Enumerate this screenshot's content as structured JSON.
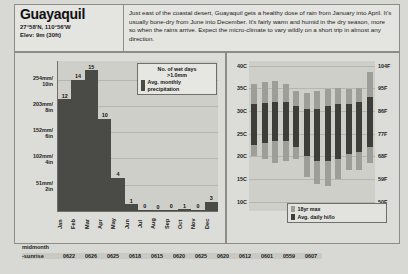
{
  "header": {
    "city": "Guayaquil",
    "coordinates": "27°58'N, 110°56'W",
    "elevation": "Elev: 9m (30ft)",
    "description": "Just east of the coastal desert, Guayaquil gets a healthy dose of rain from January into April. It's usually bone-dry from June into December. It's fairly warm and humid in the dry season, more so when the rains arrive. Expect the micro-climate to vary wildly on a short trip in almost any direction."
  },
  "precip_legend": {
    "wet_days_label": "No. of wet days\n>1.0mm",
    "wet_days_line1": "No. of wet days",
    "wet_days_line2": ">1.0mm",
    "precip_line1": "Avg. monthly",
    "precip_line2": "precipitation",
    "swatch_color": "#4a4a46"
  },
  "temp_legend": {
    "max_label": "18yr max",
    "avg_label": "Avg. daily hi/lo",
    "max_color": "#9e9e98",
    "avg_color": "#3d3d39"
  },
  "footer": {
    "caption": "midmonth",
    "row_label": "-sunrise",
    "sunrise_times": [
      "0622",
      "0626",
      "0625",
      "0618",
      "0615",
      "0620",
      "0625",
      "0620",
      "0612",
      "0601",
      "0559",
      "0607"
    ]
  },
  "chart_data": [
    {
      "type": "bar",
      "title": "Avg. monthly precipitation",
      "categories": [
        "Jan",
        "Feb",
        "Mar",
        "Apr",
        "May",
        "Jun",
        "Jul",
        "Aug",
        "Sep",
        "Oct",
        "Nov",
        "Dec"
      ],
      "values": [
        216,
        254,
        272,
        178,
        64,
        13,
        2,
        1,
        2,
        3,
        2,
        18
      ],
      "wet_days": [
        12,
        14,
        15,
        10,
        4,
        1,
        0,
        0,
        0,
        1,
        0,
        3
      ],
      "ylabel": "Precipitation",
      "ylim": [
        0,
        290
      ],
      "yticks": [
        51,
        102,
        152,
        203,
        254
      ],
      "ytick_labels": [
        {
          "mm": "51mm/",
          "in": "2in"
        },
        {
          "mm": "102mm/",
          "in": "4in"
        },
        {
          "mm": "152mm/",
          "in": "6in"
        },
        {
          "mm": "203mm/",
          "in": "8in"
        },
        {
          "mm": "254mm/",
          "in": "10in"
        }
      ],
      "grid": true,
      "legend_position": "top-right"
    },
    {
      "type": "bar",
      "title": "Temperature range",
      "categories": [
        "Jan",
        "Feb",
        "Mar",
        "Apr",
        "May",
        "Jun",
        "Jul",
        "Aug",
        "Sep",
        "Oct",
        "Nov",
        "Dec"
      ],
      "ylim": [
        8,
        41
      ],
      "yticks_c": [
        40,
        35,
        30,
        25,
        20,
        15,
        10
      ],
      "ytick_labels_c": [
        "40C",
        "35C",
        "30C",
        "25C",
        "20C",
        "15C",
        "10C"
      ],
      "yticks_f_labels": [
        "104F",
        "95F",
        "86F",
        "77F",
        "68F",
        "59F",
        "50F"
      ],
      "grid": true,
      "series": [
        {
          "name": "18yr max",
          "color": "#9e9e98",
          "range_high": [
            36.0,
            36.3,
            36.5,
            36.0,
            34.5,
            34.0,
            34.5,
            34.8,
            35.0,
            34.8,
            35.0,
            38.5
          ],
          "range_low": [
            20.0,
            19.5,
            18.5,
            19.0,
            19.5,
            15.5,
            14.0,
            13.5,
            15.0,
            17.0,
            17.0,
            18.5
          ]
        },
        {
          "name": "Avg. daily hi/lo",
          "color": "#3d3d39",
          "hi": [
            31.5,
            31.8,
            32.0,
            32.0,
            31.0,
            30.5,
            30.5,
            31.0,
            31.5,
            31.5,
            32.0,
            33.0
          ],
          "lo": [
            22.5,
            23.0,
            23.5,
            23.5,
            22.0,
            20.0,
            19.0,
            19.0,
            19.5,
            20.5,
            21.0,
            22.0
          ]
        }
      ],
      "legend_position": "bottom-center"
    }
  ]
}
